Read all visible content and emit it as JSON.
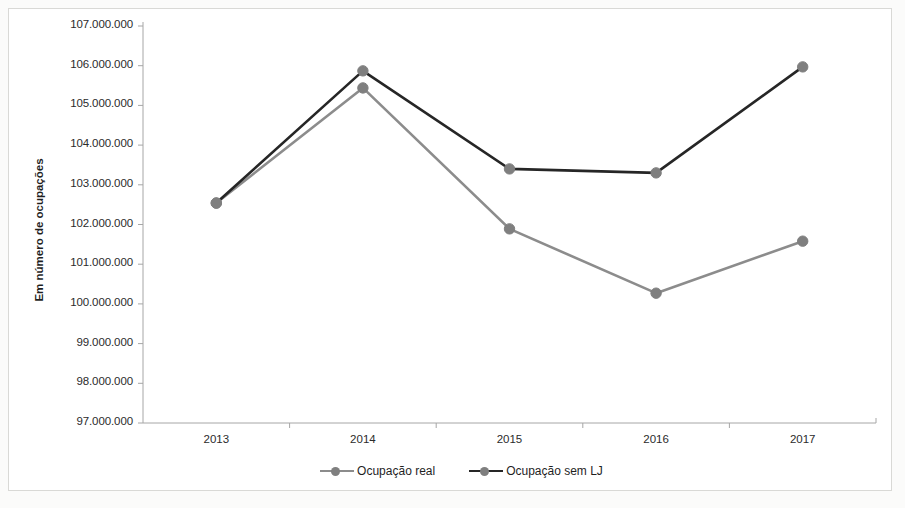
{
  "chart_data": {
    "type": "line",
    "title": "",
    "xlabel": "",
    "ylabel": "Em número de ocupações",
    "categories": [
      "2013",
      "2014",
      "2015",
      "2016",
      "2017"
    ],
    "ylim": [
      97000000,
      107000000
    ],
    "ytick_step": 1000000,
    "ytick_labels": [
      "107.000.000",
      "106.000.000",
      "105.000.000",
      "104.000.000",
      "103.000.000",
      "102.000.000",
      "101.000.000",
      "100.000.000",
      "99.000.000",
      "98.000.000",
      "97.000.000"
    ],
    "grid": false,
    "legend_position": "bottom",
    "series": [
      {
        "name": "Ocupação real",
        "color": "#8c8c8c",
        "marker_color": "#7f7f7f",
        "values": [
          102540000,
          105440000,
          101890000,
          100270000,
          101580000
        ]
      },
      {
        "name": "Ocupação sem LJ",
        "color": "#262626",
        "marker_color": "#7f7f7f",
        "values": [
          102540000,
          105870000,
          103400000,
          103300000,
          105970000
        ]
      }
    ]
  },
  "legend": {
    "items": [
      {
        "label": "Ocupação real",
        "color": "#8c8c8c"
      },
      {
        "label": "Ocupação sem LJ",
        "color": "#262626"
      }
    ]
  },
  "axis": {
    "y_title": "Em número de ocupações",
    "axis_color": "#a6a6a6"
  }
}
